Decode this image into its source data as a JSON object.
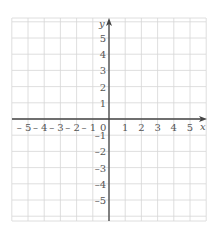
{
  "diagram": {
    "type": "coordinate-grid",
    "axes": {
      "x_label": "x",
      "y_label": "y",
      "origin_label": "0",
      "x_ticks": [
        "-5",
        "-4",
        "-3",
        "-2",
        "-1",
        "1",
        "2",
        "3",
        "4",
        "5"
      ],
      "y_ticks": [
        "5",
        "4",
        "3",
        "2",
        "1",
        "-1",
        "-2",
        "-3",
        "-4",
        "-5"
      ],
      "x_range": [
        -6,
        6
      ],
      "y_range": [
        -6,
        6
      ]
    },
    "colors": {
      "grid": "#d6d6d6",
      "axis": "#444444",
      "label": "#555555"
    }
  }
}
